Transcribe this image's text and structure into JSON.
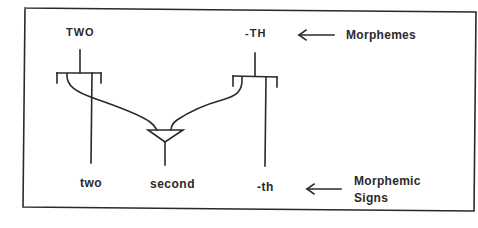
{
  "diagram": {
    "morphemes": [
      {
        "id": "two",
        "label": "TWO"
      },
      {
        "id": "th",
        "label": "-TH"
      }
    ],
    "morphemic_signs": [
      {
        "id": "two",
        "label": "two"
      },
      {
        "id": "second",
        "label": "second"
      },
      {
        "id": "th",
        "label": "-th"
      }
    ],
    "annotations": {
      "top": "Morphemes",
      "bottom_line1": "Morphemic",
      "bottom_line2": "Signs"
    },
    "edges": [
      {
        "from": "TWO",
        "to": "two",
        "type": "direct"
      },
      {
        "from": "TWO",
        "to": "second",
        "type": "merge"
      },
      {
        "from": "-TH",
        "to": "second",
        "type": "merge"
      },
      {
        "from": "-TH",
        "to": "-th",
        "type": "direct"
      }
    ],
    "colors": {
      "line": "#2a2a2a",
      "background": "#ffffff"
    }
  }
}
